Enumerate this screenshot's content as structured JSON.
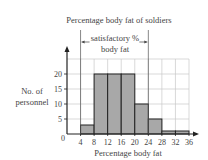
{
  "chart_data": {
    "type": "bar",
    "subtype": "histogram",
    "title": "Percentage body fat of soldiers",
    "xlabel": "Percentage body fat",
    "ylabel": "No. of personnel",
    "bins": [
      [
        4,
        8
      ],
      [
        8,
        12
      ],
      [
        12,
        16
      ],
      [
        16,
        20
      ],
      [
        20,
        24
      ],
      [
        24,
        28
      ],
      [
        28,
        32
      ],
      [
        32,
        36
      ]
    ],
    "categories": [
      "4-8",
      "8-12",
      "12-16",
      "16-20",
      "20-24",
      "24-28",
      "28-32",
      "32-36"
    ],
    "values": [
      3,
      20,
      20,
      20,
      10,
      5,
      1,
      1
    ],
    "x_ticks": [
      "0",
      "4",
      "8",
      "12",
      "16",
      "20",
      "24",
      "28",
      "32",
      "36"
    ],
    "y_ticks": [
      "5",
      "10",
      "15",
      "20"
    ],
    "xlim": [
      0,
      36
    ],
    "ylim": [
      0,
      25
    ],
    "grid": true,
    "annotation": {
      "text_line1": "satisfactory %",
      "text_line2": "body fat",
      "range": [
        4,
        24
      ]
    },
    "bar_color": "#a8a8a8",
    "grid_color": "#c8c8c8"
  }
}
